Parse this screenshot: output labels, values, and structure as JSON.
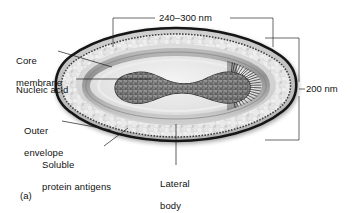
{
  "figure": {
    "panel_label": "(a)"
  },
  "dimensions": [
    {
      "id": "width",
      "label": "240–300 nm",
      "orientation": "horizontal"
    },
    {
      "id": "height",
      "label": "200 nm",
      "orientation": "vertical"
    }
  ],
  "labels": [
    {
      "id": "core-membrane",
      "line1": "Core",
      "line2": "membrane"
    },
    {
      "id": "nucleic-acid",
      "line1": "Nucleic acid",
      "line2": ""
    },
    {
      "id": "outer-envelope",
      "line1": "Outer",
      "line2": "envelope"
    },
    {
      "id": "soluble-protein-antigens",
      "line1": "Soluble",
      "line2": "protein antigens"
    },
    {
      "id": "lateral-body",
      "line1": "Lateral",
      "line2": "body"
    }
  ],
  "colors": {
    "background": "#ffffff",
    "ink": "#111111",
    "envelope_dark": "#1c1c1c",
    "envelope_mid": "#8a8a8a",
    "envelope_light": "#d8d8d8",
    "core_dark": "#4a4a4a",
    "nucleic_acid": "#6b6b6b",
    "lateral_body": "#c9c9c9"
  }
}
